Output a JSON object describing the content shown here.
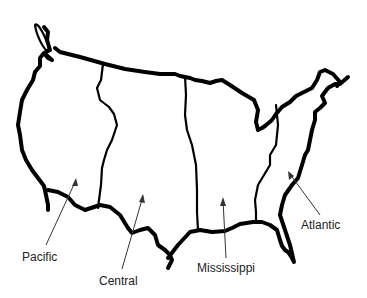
{
  "map": {
    "title": "United States time-zone regions",
    "outline_color": "#000000",
    "label_color": "#222222",
    "regions": [
      {
        "id": "pacific",
        "label": "Pacific"
      },
      {
        "id": "central",
        "label": "Central"
      },
      {
        "id": "mississippi",
        "label": "Mississippi"
      },
      {
        "id": "atlantic",
        "label": "Atlantic"
      }
    ]
  }
}
